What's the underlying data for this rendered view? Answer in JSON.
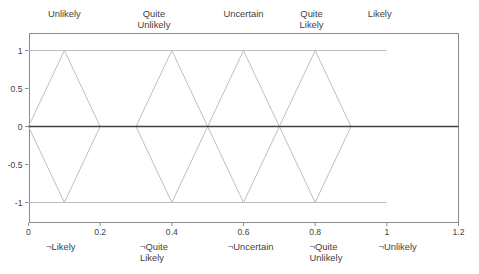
{
  "chart_data": {
    "type": "line",
    "title": "",
    "subtitle": "",
    "xlabel": "",
    "ylabel": "",
    "xlim": [
      0,
      1.2
    ],
    "ylim": [
      -1,
      1
    ],
    "xticks": [
      "0",
      "0.2",
      "0.4",
      "0.6",
      "0.8",
      "1",
      "1.2"
    ],
    "xtick_values": [
      0,
      0.2,
      0.4,
      0.6,
      0.8,
      1,
      1.2
    ],
    "yticks": [
      "1",
      "0.5",
      "0",
      "-0.5",
      "-1"
    ],
    "ytick_values": [
      1,
      0.5,
      0,
      -0.5,
      -1
    ],
    "grid": false,
    "legend": "none",
    "zero_line": true,
    "series": [
      {
        "name": "Unlikely",
        "color": "#bfbfbf",
        "points_positive": [
          [
            0,
            0
          ],
          [
            0.1,
            1
          ],
          [
            0.2,
            0
          ]
        ],
        "points_negative": [
          [
            0,
            0
          ],
          [
            0.1,
            -1
          ],
          [
            0.2,
            0
          ]
        ]
      },
      {
        "name": "Quite Unlikely",
        "color": "#bfbfbf",
        "points_positive": [
          [
            0.3,
            0
          ],
          [
            0.4,
            1
          ],
          [
            0.5,
            0
          ]
        ],
        "points_negative": [
          [
            0.3,
            0
          ],
          [
            0.4,
            -1
          ],
          [
            0.5,
            0
          ]
        ]
      },
      {
        "name": "Uncertain",
        "color": "#bfbfbf",
        "points_positive": [
          [
            0.5,
            0
          ],
          [
            0.6,
            1
          ],
          [
            0.7,
            0
          ]
        ],
        "points_negative": [
          [
            0.5,
            0
          ],
          [
            0.6,
            -1
          ],
          [
            0.7,
            0
          ]
        ]
      },
      {
        "name": "Quite Likely",
        "color": "#bfbfbf",
        "points_positive": [
          [
            0.7,
            0
          ],
          [
            0.8,
            1
          ],
          [
            0.9,
            0
          ]
        ],
        "points_negative": [
          [
            0.7,
            0
          ],
          [
            0.8,
            -1
          ],
          [
            0.9,
            0
          ]
        ]
      },
      {
        "name": "Likely",
        "color": "#bfbfbf",
        "points_positive": [
          [
            0.0,
            1
          ],
          [
            1.0,
            1
          ]
        ],
        "points_negative": [
          [
            0.0,
            -1
          ],
          [
            1.0,
            -1
          ]
        ]
      }
    ],
    "top_labels": [
      {
        "text": "Unlikely",
        "x": 0.1
      },
      {
        "text": "Quite\nUnlikely",
        "x": 0.35
      },
      {
        "text": "Uncertain",
        "x": 0.6
      },
      {
        "text": "Quite\nLikely",
        "x": 0.79
      },
      {
        "text": "Likely",
        "x": 0.98
      }
    ],
    "bottom_labels": [
      {
        "text": "¬Likely",
        "x": 0.09
      },
      {
        "text": "¬Quite\nLikely",
        "x": 0.35
      },
      {
        "text": "¬Uncertain",
        "x": 0.62
      },
      {
        "text": "¬Quite\nUnlikely",
        "x": 0.83
      },
      {
        "text": "¬Unlikely",
        "x": 1.03
      }
    ]
  },
  "colors": {
    "line": "#bfbfbf",
    "frame": "#8c8c8c",
    "zero_axis": "#404040",
    "text": "#3f3f3f",
    "background": "#ffffff"
  }
}
